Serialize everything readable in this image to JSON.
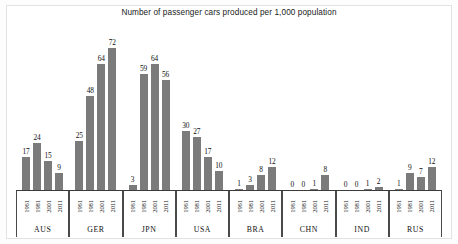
{
  "chart_data": {
    "type": "bar",
    "title": "Number of passenger cars produced per 1,000 population",
    "xlabel": "",
    "ylabel": "",
    "ylim": [
      0,
      80
    ],
    "grid": false,
    "legend": "none",
    "categories": [
      "1961",
      "1981",
      "2001",
      "2011"
    ],
    "group_labels": [
      "AUS",
      "GER",
      "JPN",
      "USA",
      "BRA",
      "CHN",
      "IND",
      "RUS"
    ],
    "bar_color": "#7b7b7b",
    "groups": [
      {
        "label": "AUS",
        "years": [
          "1961",
          "1981",
          "2001",
          "2011"
        ],
        "values": [
          17,
          24,
          15,
          9
        ]
      },
      {
        "label": "GER",
        "years": [
          "1961",
          "1981",
          "2001",
          "2011"
        ],
        "values": [
          25,
          48,
          64,
          72
        ]
      },
      {
        "label": "JPN",
        "years": [
          "1961",
          "1981",
          "2001",
          "2011"
        ],
        "values": [
          3,
          59,
          64,
          56
        ]
      },
      {
        "label": "USA",
        "years": [
          "1961",
          "1981",
          "2001",
          "2011"
        ],
        "values": [
          30,
          27,
          17,
          10
        ]
      },
      {
        "label": "BRA",
        "years": [
          "1961",
          "1981",
          "2001",
          "2011"
        ],
        "values": [
          1,
          3,
          8,
          12
        ]
      },
      {
        "label": "CHN",
        "years": [
          "1961",
          "1981",
          "2001",
          "2011"
        ],
        "values": [
          0,
          0,
          1,
          8
        ]
      },
      {
        "label": "IND",
        "years": [
          "1961",
          "1981",
          "2001",
          "2011"
        ],
        "values": [
          0,
          0,
          1,
          2
        ]
      },
      {
        "label": "RUS",
        "years": [
          "1961",
          "1981",
          "2001",
          "2011"
        ],
        "values": [
          1,
          9,
          7,
          12
        ]
      }
    ]
  }
}
